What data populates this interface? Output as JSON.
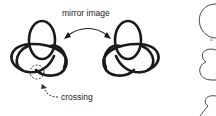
{
  "labels": {
    "mirror": "mirror image",
    "crossing": "crossing",
    "partial_letter": "u"
  },
  "colors": {
    "stroke": "#1a1a1a",
    "background": "#ffffff",
    "text": "#222222"
  }
}
